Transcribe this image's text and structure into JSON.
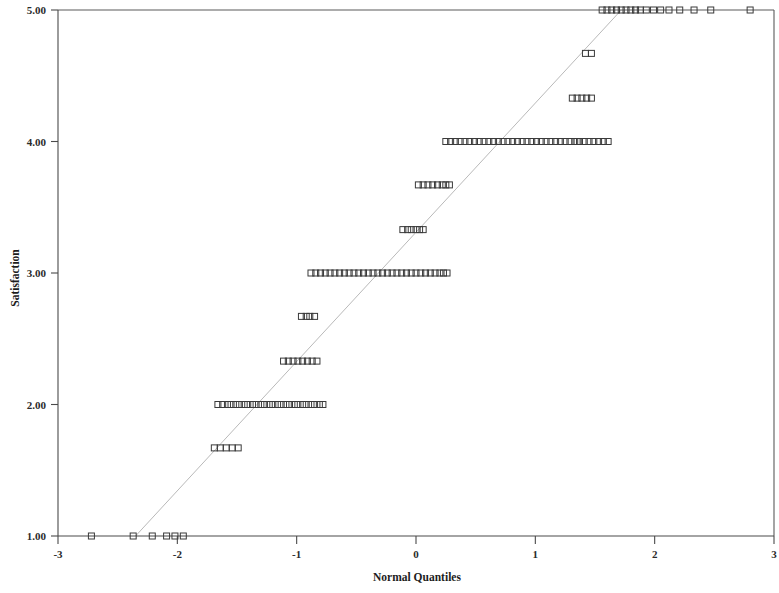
{
  "chart_data": {
    "type": "scatter",
    "title": "",
    "subtitle": "",
    "xlabel": "Normal Quantiles",
    "ylabel": "Satisfaction",
    "xlim": [
      -3,
      3
    ],
    "ylim": [
      1.0,
      5.0
    ],
    "xticks": [
      -3,
      -2,
      -1,
      0,
      1,
      2,
      3
    ],
    "xtick_labels": [
      "-3",
      "-2",
      "-1",
      "0",
      "1",
      "2",
      "3"
    ],
    "yticks": [
      1.0,
      2.0,
      3.0,
      4.0,
      5.0
    ],
    "ytick_labels": [
      "1.00",
      "2.00",
      "3.00",
      "4.00",
      "5.00"
    ],
    "grid": false,
    "legend": null,
    "marker_style": "open-square",
    "marker_size_px": 6,
    "marker_color": "#3a3a3a",
    "reference_line": {
      "label": "normal reference line",
      "color": "#b9b9b9",
      "style": "solid-thin",
      "x_start": -2.35,
      "y_start": 1.0,
      "x_end": 1.72,
      "y_end": 5.0
    },
    "levels": [
      {
        "y": 1.0,
        "label": "1.00",
        "count": 6,
        "x": [
          -2.72,
          -2.37,
          -2.21,
          -2.09,
          -2.02,
          -1.95
        ]
      },
      {
        "y": 1.67,
        "label": "1.67",
        "count": 5,
        "x": [
          -1.69,
          -1.64,
          -1.59,
          -1.54,
          -1.49
        ]
      },
      {
        "y": 2.0,
        "label": "2.00",
        "count": 26,
        "x": [
          -1.66,
          -1.62,
          -1.58,
          -1.55,
          -1.51,
          -1.48,
          -1.44,
          -1.41,
          -1.37,
          -1.34,
          -1.3,
          -1.27,
          -1.23,
          -1.2,
          -1.16,
          -1.13,
          -1.09,
          -1.06,
          -1.02,
          -0.99,
          -0.95,
          -0.92,
          -0.88,
          -0.85,
          -0.81,
          -0.78
        ]
      },
      {
        "y": 2.33,
        "label": "2.33",
        "count": 8,
        "x": [
          -1.11,
          -1.07,
          -1.03,
          -0.99,
          -0.95,
          -0.91,
          -0.87,
          -0.83
        ]
      },
      {
        "y": 2.67,
        "label": "2.67",
        "count": 4,
        "x": [
          -0.96,
          -0.92,
          -0.89,
          -0.85
        ]
      },
      {
        "y": 3.0,
        "label": "3.00",
        "count": 30,
        "x": [
          -0.88,
          -0.84,
          -0.8,
          -0.76,
          -0.72,
          -0.68,
          -0.64,
          -0.6,
          -0.56,
          -0.52,
          -0.48,
          -0.44,
          -0.4,
          -0.36,
          -0.32,
          -0.28,
          -0.24,
          -0.2,
          -0.16,
          -0.12,
          -0.08,
          -0.04,
          0.0,
          0.04,
          0.08,
          0.12,
          0.16,
          0.2,
          0.23,
          0.26
        ]
      },
      {
        "y": 3.33,
        "label": "3.33",
        "count": 6,
        "x": [
          -0.11,
          -0.07,
          -0.04,
          0.0,
          0.03,
          0.06
        ]
      },
      {
        "y": 3.67,
        "label": "3.67",
        "count": 8,
        "x": [
          0.02,
          0.06,
          0.1,
          0.14,
          0.18,
          0.22,
          0.25,
          0.28
        ]
      },
      {
        "y": 4.0,
        "label": "4.00",
        "count": 36,
        "x": [
          0.25,
          0.29,
          0.33,
          0.37,
          0.41,
          0.45,
          0.49,
          0.53,
          0.57,
          0.61,
          0.65,
          0.69,
          0.73,
          0.77,
          0.81,
          0.85,
          0.89,
          0.93,
          0.97,
          1.01,
          1.05,
          1.09,
          1.13,
          1.17,
          1.21,
          1.25,
          1.29,
          1.33,
          1.37,
          1.41,
          1.45,
          1.49,
          1.53,
          1.57,
          1.61,
          1.35
        ]
      },
      {
        "y": 4.33,
        "label": "4.33",
        "count": 5,
        "x": [
          1.31,
          1.35,
          1.39,
          1.43,
          1.47
        ]
      },
      {
        "y": 4.67,
        "label": "4.67",
        "count": 2,
        "x": [
          1.42,
          1.47
        ]
      },
      {
        "y": 5.0,
        "label": "5.00",
        "count": 17,
        "x": [
          1.56,
          1.6,
          1.64,
          1.68,
          1.72,
          1.76,
          1.8,
          1.84,
          1.88,
          1.93,
          1.99,
          2.05,
          2.12,
          2.21,
          2.33,
          2.47,
          2.8
        ]
      }
    ]
  }
}
